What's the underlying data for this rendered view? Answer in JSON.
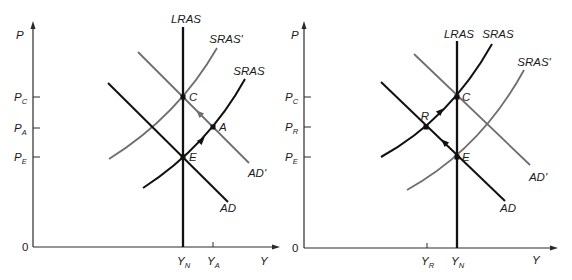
{
  "figure": {
    "left_panel": {
      "y_axis_label": "P",
      "x_axis_label": "Y",
      "origin_label": "0",
      "price_ticks": [
        {
          "main": "P",
          "sub": "C"
        },
        {
          "main": "P",
          "sub": "A"
        },
        {
          "main": "P",
          "sub": "E"
        }
      ],
      "output_ticks": [
        {
          "main": "Y",
          "sub": "N"
        },
        {
          "main": "Y",
          "sub": "A"
        }
      ],
      "curves": {
        "lras": "LRAS",
        "sras": "SRAS",
        "sras_prime": "SRAS'",
        "ad": "AD",
        "ad_prime": "AD'"
      },
      "points": {
        "c": "C",
        "e": "E",
        "a": "A"
      }
    },
    "right_panel": {
      "y_axis_label": "P",
      "x_axis_label": "Y",
      "origin_label": "0",
      "price_ticks": [
        {
          "main": "P",
          "sub": "C"
        },
        {
          "main": "P",
          "sub": "R"
        },
        {
          "main": "P",
          "sub": "E"
        }
      ],
      "output_ticks": [
        {
          "main": "Y",
          "sub": "R"
        },
        {
          "main": "Y",
          "sub": "N"
        }
      ],
      "curves": {
        "lras": "LRAS",
        "sras": "SRAS",
        "sras_prime": "SRAS'",
        "ad": "AD",
        "ad_prime": "AD'"
      },
      "points": {
        "r": "R",
        "c": "C",
        "e": "E"
      }
    }
  },
  "colors": {
    "original_curves": "#111111",
    "shifted_curves": "#6e6e6e"
  }
}
